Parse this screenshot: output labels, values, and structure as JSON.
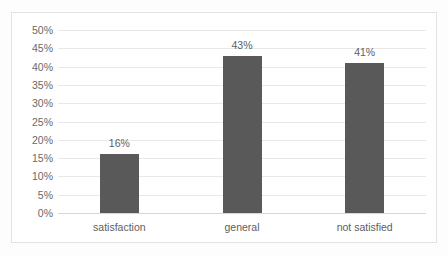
{
  "chart_data": {
    "type": "bar",
    "title": "",
    "subtitle": "",
    "xlabel": "",
    "ylabel": "",
    "categories": [
      "satisfaction",
      "general",
      "not satisfied"
    ],
    "values": [
      16,
      43,
      41
    ],
    "data_labels": [
      "16%",
      "43%",
      "41%"
    ],
    "ylim": [
      0,
      50
    ],
    "ytick_values": [
      0,
      5,
      10,
      15,
      20,
      25,
      30,
      35,
      40,
      45,
      50
    ],
    "ytick_labels": [
      "0%",
      "5%",
      "10%",
      "15%",
      "20%",
      "25%",
      "30%",
      "35%",
      "40%",
      "45%",
      "50%"
    ],
    "grid": true,
    "grid_axis": "y",
    "legend": false,
    "legend_position": "none",
    "series": [
      {
        "name": "",
        "values": [
          16,
          43,
          41
        ]
      }
    ],
    "colors": {
      "bar": "#595959",
      "gridline": "#e8e8e8",
      "baseline": "#d6d6d6",
      "plot_background": "#ffffff",
      "figure_border": "#e3e3e3",
      "page_background": "#fdfdfd",
      "tick_label": "#6a6a6a",
      "data_label": "#5e5e5e",
      "category_label": "#5e5e5e"
    }
  }
}
